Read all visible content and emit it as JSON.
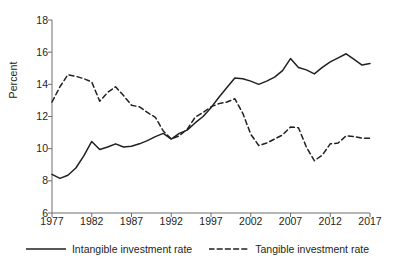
{
  "chart_data": {
    "type": "line",
    "title": "",
    "xlabel": "",
    "ylabel": "Percent",
    "xlim": [
      1977,
      2017
    ],
    "ylim": [
      6,
      18
    ],
    "ytick_labels": [
      "18",
      "16",
      "14",
      "12",
      "10",
      "8",
      "6"
    ],
    "ytick_values": [
      18,
      16,
      14,
      12,
      10,
      8,
      6
    ],
    "xtick_labels": [
      "1977",
      "1982",
      "1987",
      "1992",
      "1997",
      "2002",
      "2007",
      "2012",
      "2017"
    ],
    "xtick_values": [
      1977,
      1982,
      1987,
      1992,
      1997,
      2002,
      2007,
      2012,
      2017
    ],
    "grid": false,
    "legend_position": "bottom",
    "x": [
      1977,
      1978,
      1979,
      1980,
      1981,
      1982,
      1983,
      1984,
      1985,
      1986,
      1987,
      1988,
      1989,
      1990,
      1991,
      1992,
      1993,
      1994,
      1995,
      1996,
      1997,
      1998,
      1999,
      2000,
      2001,
      2002,
      2003,
      2004,
      2005,
      2006,
      2007,
      2008,
      2009,
      2010,
      2011,
      2012,
      2013,
      2014,
      2015,
      2016,
      2017
    ],
    "series": [
      {
        "name": "Intangible investment rate",
        "style": "solid",
        "color": "#231f20",
        "values": [
          8.4,
          8.15,
          8.35,
          8.8,
          9.55,
          10.45,
          9.95,
          10.1,
          10.3,
          10.1,
          10.15,
          10.3,
          10.5,
          10.75,
          10.95,
          10.6,
          10.95,
          11.15,
          11.6,
          12.0,
          12.55,
          13.2,
          13.8,
          14.4,
          14.35,
          14.2,
          14.0,
          14.2,
          14.45,
          14.85,
          15.6,
          15.05,
          14.9,
          14.65,
          15.05,
          15.4,
          15.65,
          15.9,
          15.55,
          15.2,
          15.3
        ]
      },
      {
        "name": "Tangible investment rate",
        "style": "dashed",
        "color": "#231f20",
        "values": [
          12.9,
          13.85,
          14.6,
          14.5,
          14.35,
          14.15,
          12.95,
          13.5,
          13.85,
          13.3,
          12.7,
          12.6,
          12.25,
          11.95,
          11.1,
          10.6,
          10.8,
          11.2,
          11.95,
          12.25,
          12.6,
          12.8,
          12.9,
          13.1,
          12.2,
          10.9,
          10.2,
          10.35,
          10.6,
          10.85,
          11.35,
          11.3,
          10.1,
          9.25,
          9.6,
          10.3,
          10.35,
          10.8,
          10.75,
          10.65,
          10.65
        ]
      }
    ]
  },
  "legend": {
    "items": [
      {
        "label": "Intangible investment rate",
        "style": "solid"
      },
      {
        "label": "Tangible investment rate",
        "style": "dashed"
      }
    ]
  }
}
